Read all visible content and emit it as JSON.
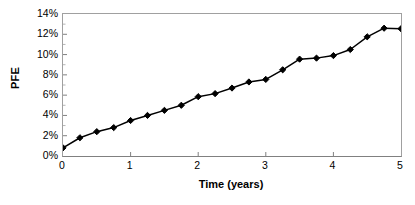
{
  "chart_data": {
    "type": "line",
    "title": "",
    "xlabel": "Time (years)",
    "ylabel": "PFE",
    "x": [
      0,
      0.25,
      0.5,
      0.75,
      1,
      1.25,
      1.5,
      1.75,
      2,
      2.25,
      2.5,
      2.75,
      3,
      3.25,
      3.5,
      3.75,
      4,
      4.25,
      4.5,
      4.75,
      5
    ],
    "values": [
      0.8,
      1.8,
      2.4,
      2.8,
      3.5,
      4.0,
      4.5,
      5.0,
      5.85,
      6.15,
      6.7,
      7.3,
      7.55,
      8.5,
      9.55,
      9.65,
      9.9,
      10.5,
      11.75,
      12.6,
      12.55
    ],
    "series": [
      {
        "name": "PFE",
        "values": [
          0.8,
          1.8,
          2.4,
          2.8,
          3.5,
          4.0,
          4.5,
          5.0,
          5.85,
          6.15,
          6.7,
          7.3,
          7.55,
          8.5,
          9.55,
          9.65,
          9.9,
          10.5,
          11.75,
          12.6,
          12.55
        ]
      }
    ],
    "xlim": [
      0,
      5
    ],
    "ylim": [
      0,
      14
    ],
    "x_ticks": [
      0,
      1,
      2,
      3,
      4,
      5
    ],
    "x_tick_labels": [
      "0",
      "1",
      "2",
      "3",
      "4",
      "5"
    ],
    "y_ticks": [
      0,
      2,
      4,
      6,
      8,
      10,
      12,
      14
    ],
    "y_tick_labels": [
      "0%",
      "2%",
      "4%",
      "6%",
      "8%",
      "10%",
      "12%",
      "14%"
    ],
    "y_minor_ticks": [
      1,
      3,
      5,
      7,
      9,
      11,
      13
    ],
    "grid": false,
    "legend": false,
    "legend_position": "none",
    "marker": "diamond",
    "marker_color": "#000000",
    "line_color": "#000000",
    "plot_background": "#FFFFFF",
    "frame_color": "#A0A0A0",
    "axis_color": "#808080"
  }
}
